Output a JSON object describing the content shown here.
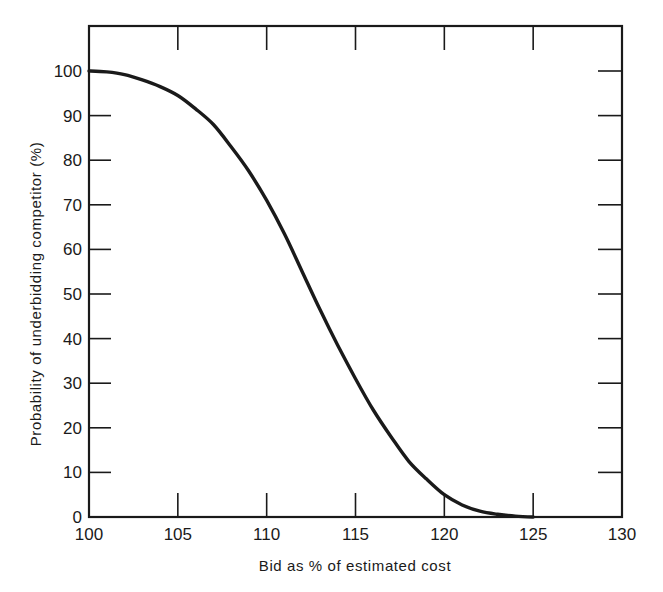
{
  "chart_data": {
    "type": "line",
    "title": "",
    "xlabel": "Bid as % of estimated cost",
    "ylabel": "Probability of underbidding competitor (%)",
    "xlim": [
      100,
      130
    ],
    "ylim": [
      0,
      100
    ],
    "grid": false,
    "legend": null,
    "x_ticks": [
      100,
      105,
      110,
      115,
      120,
      125,
      130
    ],
    "y_ticks": [
      0,
      10,
      20,
      30,
      40,
      50,
      60,
      70,
      80,
      90,
      100
    ],
    "series": [
      {
        "name": "Probability of underbidding competitor",
        "color": "#1a1a1a",
        "x": [
          100,
          101,
          102,
          103,
          104,
          105,
          106,
          107,
          108,
          109,
          110,
          111,
          112,
          113,
          114,
          115,
          116,
          117,
          118,
          119,
          120,
          121,
          122,
          123,
          124,
          125
        ],
        "y": [
          100,
          99.8,
          99.2,
          98,
          96.5,
          94.5,
          91.5,
          88,
          83,
          77.5,
          71,
          63.5,
          55,
          46.5,
          38.5,
          31,
          24,
          18,
          12.5,
          8.5,
          5,
          2.7,
          1.3,
          0.6,
          0.2,
          0
        ]
      }
    ]
  },
  "labels": {
    "x_axis_title": "Bid as % of estimated cost",
    "y_axis_title": "Probability of underbidding competitor (%)"
  }
}
